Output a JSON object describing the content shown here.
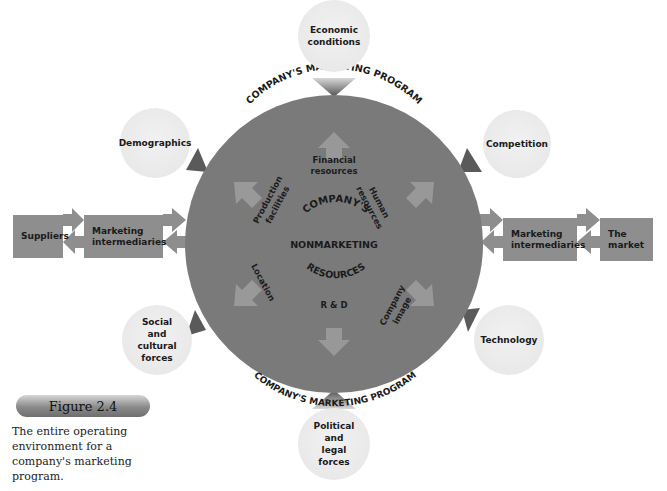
{
  "diagram": {
    "center": {
      "title_lines": [
        "COMPANY'S",
        "NONMARKETING",
        "RESOURCES"
      ],
      "ring_top": "COMPANY'S MARKETING PROGRAM",
      "ring_bottom": "COMPANY'S MARKETING PROGRAM",
      "resources": [
        {
          "id": "financial",
          "label": "Financial resources"
        },
        {
          "id": "human",
          "label": "Human resources"
        },
        {
          "id": "company-image",
          "label": "Company image"
        },
        {
          "id": "rnd",
          "label": "R & D"
        },
        {
          "id": "location",
          "label": "Location"
        },
        {
          "id": "production",
          "label": "Production facilities"
        }
      ]
    },
    "external_forces": [
      {
        "id": "economic",
        "label": "Economic conditions"
      },
      {
        "id": "competition",
        "label": "Competition"
      },
      {
        "id": "technology",
        "label": "Technology"
      },
      {
        "id": "political",
        "label": "Political and legal forces"
      },
      {
        "id": "social",
        "label": "Social and cultural forces"
      },
      {
        "id": "demographics",
        "label": "Demographics"
      }
    ],
    "flow_left": [
      {
        "id": "suppliers",
        "label": "Suppliers"
      },
      {
        "id": "marketing-intermediaries-left",
        "label": "Marketing intermediaries"
      }
    ],
    "flow_right": [
      {
        "id": "marketing-intermediaries-right",
        "label": "Marketing intermediaries"
      },
      {
        "id": "the-market",
        "label": "The market"
      }
    ]
  },
  "figure": {
    "number": "Figure 2.4",
    "caption": "The entire operating environment for a company's marketing program."
  },
  "colors": {
    "circle": "#7a7a7a",
    "box": "#8e8e8e",
    "bubble": "#ececec",
    "text": "#1a1a1a"
  }
}
